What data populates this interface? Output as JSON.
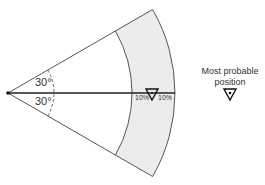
{
  "diagram": {
    "angle_upper": "30°",
    "angle_lower": "30°",
    "pct_left": "10%",
    "pct_right": "10%",
    "legend_line1": "Most probable",
    "legend_line2": "position",
    "colors": {
      "band": "#ececec",
      "line": "#555555",
      "axis": "#222222"
    }
  }
}
